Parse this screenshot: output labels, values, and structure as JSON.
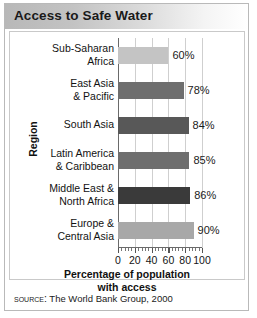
{
  "figure": {
    "title": "Access to Safe Water",
    "source_label": "Source:",
    "source_text": "The World Bank Group, 2000"
  },
  "chart_data": {
    "type": "bar",
    "orientation": "horizontal",
    "title": "Access to Safe Water",
    "xlabel": "Percentage of population with access",
    "ylabel": "Region",
    "xlim": [
      0,
      100
    ],
    "xticks": [
      0,
      20,
      40,
      60,
      80,
      100
    ],
    "xtick_labels": [
      "0",
      "20",
      "40",
      "60",
      "80",
      "100"
    ],
    "minor_ticks_per_interval": 4,
    "grid": "vertical",
    "legend": "none",
    "categories": [
      "Sub-Saharan Africa",
      "East Asia & Pacific",
      "South Asia",
      "Latin America & Caribbean",
      "Middle East & North Africa",
      "Europe & Central Asia"
    ],
    "category_lines": [
      [
        "Sub-Saharan",
        "Africa"
      ],
      [
        "East Asia",
        "& Pacific"
      ],
      [
        "South Asia"
      ],
      [
        "Latin America",
        "& Caribbean"
      ],
      [
        "Middle East &",
        "North Africa"
      ],
      [
        "Europe &",
        "Central Asia"
      ]
    ],
    "values": [
      60,
      78,
      84,
      85,
      86,
      90
    ],
    "value_labels": [
      "60%",
      "78%",
      "84%",
      "85%",
      "86%",
      "90%"
    ],
    "bar_colors": [
      "#c4c4c4",
      "#6e6e6e",
      "#585858",
      "#6e6e6e",
      "#3a3a3a",
      "#a8a8a8"
    ]
  },
  "axis_title_lines": {
    "line1": "Percentage of population",
    "line2": "with access"
  }
}
